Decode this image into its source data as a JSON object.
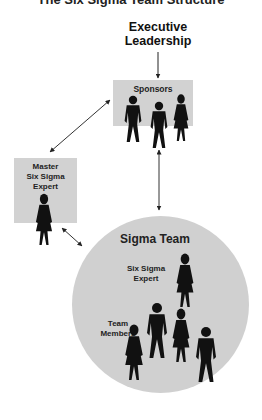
{
  "title": "The Six Sigma Team Structure",
  "nodes": {
    "executive": "Executive\nLeadership",
    "executive_lines": [
      "Executive",
      "Leadership"
    ],
    "sponsors": "Sponsors",
    "master_lines": [
      "Master",
      "Six Sigma",
      "Expert"
    ],
    "sigma_team": "Sigma Team",
    "expert_lines": [
      "Six Sigma",
      "Expert"
    ],
    "members_lines": [
      "Team",
      "Members"
    ]
  },
  "colors": {
    "box_fill": "#d2d2d2",
    "circle_fill": "#d0d0d0",
    "figure": "#111111",
    "arrow": "#333333"
  },
  "edges": [
    {
      "from": "Executive Leadership",
      "to": "Sponsors",
      "type": "one-way"
    },
    {
      "from": "Sponsors",
      "to": "Master Six Sigma Expert",
      "type": "two-way"
    },
    {
      "from": "Sponsors",
      "to": "Sigma Team",
      "type": "two-way"
    },
    {
      "from": "Master Six Sigma Expert",
      "to": "Sigma Team",
      "type": "two-way"
    }
  ]
}
